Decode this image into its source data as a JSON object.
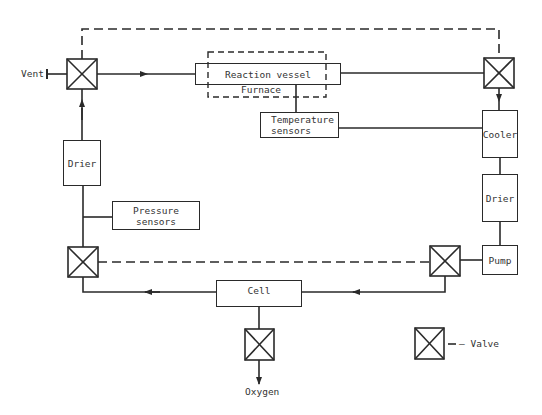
{
  "diagram": {
    "type": "process-flow",
    "components": {
      "reaction_vessel": "Reaction vessel",
      "furnace": "Furnace",
      "temperature_sensors_line1": "Temperature",
      "temperature_sensors_line2": "sensors",
      "cooler": "Cooler",
      "drier_right": "Drier",
      "pump": "Pump",
      "cell": "Cell",
      "drier_left": "Drier",
      "pressure_sensors_line1": "Pressure",
      "pressure_sensors_line2": "sensors"
    },
    "labels": {
      "vent": "Vent",
      "oxygen": "Oxygen"
    },
    "legend": {
      "valve_label": "— Valve"
    },
    "colors": {
      "line": "#2a2a2a",
      "background": "#ffffff"
    },
    "valves": [
      {
        "id": "valve-vent",
        "cx": 82,
        "cy": 74
      },
      {
        "id": "valve-top-right",
        "cx": 499,
        "cy": 73
      },
      {
        "id": "valve-bottom-left",
        "cx": 83,
        "cy": 262
      },
      {
        "id": "valve-bottom-right",
        "cx": 445,
        "cy": 261
      },
      {
        "id": "valve-oxygen",
        "cx": 260,
        "cy": 344
      },
      {
        "id": "valve-legend",
        "cx": 429,
        "cy": 343
      }
    ]
  }
}
